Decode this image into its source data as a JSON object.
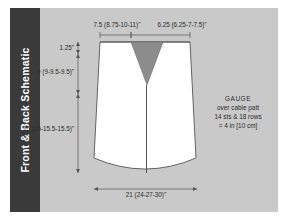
{
  "panel": {
    "background_color": "#c9c9c9",
    "page_background": "#ffffff"
  },
  "sidebar": {
    "title": "Front & Back Schematic",
    "background_color": "#3a3a3a",
    "text_color": "#ffffff"
  },
  "schematic": {
    "garment_fill": "#ffffff",
    "neckline_fill": "#8c8c8c",
    "line_color": "#555555",
    "measurements": {
      "shoulder_to_neck_width": "7.5 (8.75-10-11)\"",
      "neck_width": "6.25 (6.25-7-7.5)\"",
      "shoulder_slope_depth": "1.25\"",
      "armhole_depth": "9 (9-9.5-9.5)\"",
      "body_length": "15 (15-15.5-15.5)\"",
      "bottom_width": "21 (24-27-30)\""
    }
  },
  "gauge": {
    "title": "GAUGE",
    "line1": "over cable patt",
    "line2": "14 sts & 18 rows",
    "line3": "= 4 in [10 cm]"
  }
}
